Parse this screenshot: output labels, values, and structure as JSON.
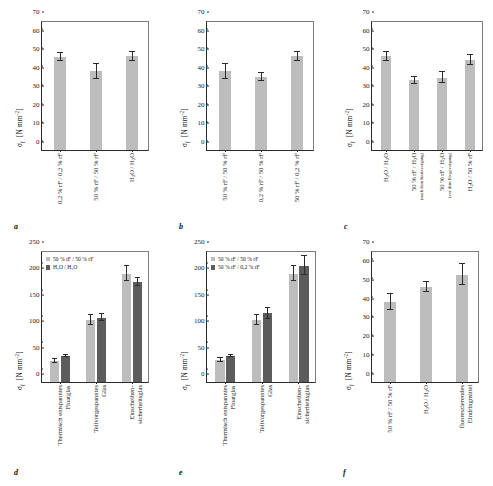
{
  "figure": {
    "panels": [
      "a",
      "b",
      "c",
      "d",
      "e",
      "f"
    ]
  },
  "chart_data": [
    {
      "id": "a",
      "type": "bar",
      "title": "",
      "panel_letter": "a",
      "ylabel": "σf  [N mm-2]",
      "ylim": [
        0,
        70
      ],
      "yticks": [
        0,
        10,
        20,
        30,
        40,
        50,
        60,
        70
      ],
      "grid": false,
      "legend": null,
      "categories": [
        "0,2 % rF / 0,2 % rF",
        "50 % rF / 50 % rF",
        "H2O / H2O"
      ],
      "values": [
        50.0,
        42.5,
        50.5
      ],
      "errors": [
        2.2,
        4.0,
        2.5
      ],
      "xlabel": ""
    },
    {
      "id": "b",
      "type": "bar",
      "panel_letter": "b",
      "ylabel": "σf  [N mm-2]",
      "ylim": [
        0,
        70
      ],
      "yticks": [
        0,
        10,
        20,
        30,
        40,
        50,
        60,
        70
      ],
      "grid": false,
      "legend": null,
      "categories": [
        "50 % rF / 50 % rF",
        "0,2 % rF / 50 % rF",
        "50 % rF / 0,2 % rF"
      ],
      "values": [
        42.5,
        39.5,
        50.5
      ],
      "errors": [
        4.0,
        2.2,
        2.5
      ],
      "xlabel": ""
    },
    {
      "id": "c",
      "type": "bar",
      "panel_letter": "c",
      "ylabel": "σf  [N mm-2]",
      "ylim": [
        0,
        70
      ],
      "yticks": [
        0,
        10,
        20,
        30,
        40,
        50,
        60,
        70
      ],
      "grid": false,
      "legend": null,
      "categories": [
        "H2O / H2O",
        "50 % rF / H2O (nach dem Kratzvorgang)",
        "50 % rF / H2O (vor dem Biegevorgang)",
        "H2O / 50 % rF"
      ],
      "values": [
        50.5,
        37.5,
        39.0,
        48.5
      ],
      "errors": [
        2.5,
        1.8,
        2.8,
        2.6
      ],
      "xlabel": ""
    },
    {
      "id": "d",
      "type": "bar",
      "panel_letter": "d",
      "ylabel": "σf  [N mm-2]",
      "ylim": [
        0,
        250
      ],
      "yticks": [
        0,
        50,
        100,
        150,
        200,
        250
      ],
      "grid": false,
      "legend_position": "top-left",
      "categories": [
        "Thermisch entspanntes Floatglas",
        "Teilvorgespanntes Glas",
        "Einscheiben-sicherheitsglas"
      ],
      "series": [
        {
          "name": "50 % rF / 50 % rF",
          "values": [
            40,
            118,
            205
          ],
          "errors": [
            4,
            9,
            14
          ]
        },
        {
          "name": "H2O / H2O",
          "values": [
            50,
            122,
            190
          ],
          "errors": [
            2,
            7,
            7
          ]
        }
      ],
      "xlabel": ""
    },
    {
      "id": "e",
      "type": "bar",
      "panel_letter": "e",
      "ylabel": "σf  [N mm-2]",
      "ylim": [
        0,
        250
      ],
      "yticks": [
        0,
        50,
        100,
        150,
        200,
        250
      ],
      "grid": false,
      "legend_position": "top-left",
      "categories": [
        "Thermisch entspanntes Floatglas",
        "Teilvorgespanntes Glas",
        "Einscheiben-sicherheitsglas"
      ],
      "series": [
        {
          "name": "50 % rF / 50 % rF",
          "values": [
            42,
            118,
            205
          ],
          "errors": [
            4,
            9,
            14
          ]
        },
        {
          "name": "50 % rF / 0,2 % rF",
          "values": [
            49,
            130,
            220
          ],
          "errors": [
            2,
            10,
            18
          ]
        }
      ],
      "xlabel": ""
    },
    {
      "id": "f",
      "type": "bar",
      "panel_letter": "f",
      "ylabel": "σf  [N mm-2]",
      "ylim": [
        0,
        70
      ],
      "yticks": [
        0,
        10,
        20,
        30,
        40,
        50,
        60,
        70
      ],
      "grid": false,
      "legend": null,
      "categories": [
        "50 % rF / 50 % rF",
        "H2O / H2O",
        "fluoreszierendes Eindringmittel"
      ],
      "values": [
        42.5,
        50.5,
        57.0
      ],
      "errors": [
        4.0,
        2.5,
        5.5
      ],
      "xlabel": ""
    }
  ],
  "labels": {
    "a": {
      "letter": "a",
      "ylabel_main": "σ",
      "ylabel_sub": "f",
      "ylabel_unit": "[N mm",
      "ylabel_exp": "-2",
      "ylabel_close": "]",
      "x": [
        "0,2 % rF / 0,2 % rF",
        "50 % rF / 50 % rF",
        "H",
        "O / H",
        "O"
      ]
    },
    "b": {
      "letter": "b"
    },
    "c": {
      "letter": "c",
      "note1": "(nach dem Kratzvorgang)",
      "note2": "(vor dem Biegevorgang)"
    },
    "d": {
      "letter": "d",
      "legend1": "50 % rF / 50 % rF",
      "legend2": "H₂O / H₂O",
      "cat1a": "Thermisch entspanntes",
      "cat1b": "Floatglas",
      "cat2a": "Teilvorgespanntes",
      "cat2b": "Glas",
      "cat3a": "Einscheiben-",
      "cat3b": "sicherheitsglas"
    },
    "e": {
      "letter": "e",
      "legend1": "50 % rF / 50 % rF",
      "legend2": "50 % rF / 0,2 % rF"
    },
    "f": {
      "letter": "f",
      "cat3a": "fluoreszierendes",
      "cat3b": "Eindringmittel"
    }
  },
  "colors": {
    "bar_light": "#bdbdbd",
    "bar_dark": "#5c5c5c",
    "axis": "#2b2b2b",
    "text": "#1a1a1a"
  }
}
